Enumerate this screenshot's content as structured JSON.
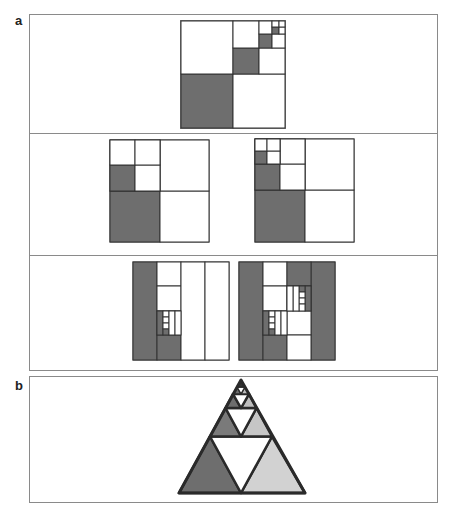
{
  "figure": {
    "panel_labels": {
      "a": "a",
      "b": "b"
    },
    "colors": {
      "dark_fill": "#6e6e6e",
      "medium_fill": "#8c8c8c",
      "light_fill": "#cfcfcf",
      "white_fill": "#ffffff",
      "line": "#333333",
      "border": "#8a8a8a"
    },
    "panel_a": {
      "description": "Geometric series of nested squares; one of every four sub-squares shaded (1/4 + 1/16 + ... = 1/3)",
      "rows": [
        {
          "name": "row-1",
          "items": [
            "recursive-square-diagonal"
          ]
        },
        {
          "name": "row-2",
          "items": [
            "recursive-square-left-column-variant-1",
            "recursive-square-left-column-variant-2"
          ]
        },
        {
          "name": "row-3",
          "items": [
            "column-strip-variant-1",
            "column-strip-variant-2"
          ]
        }
      ]
    },
    "panel_b": {
      "description": "Sierpinski-style nested triangle; each level split into four triangles with left shaded dark, right light, center white, top recursively subdivided"
    }
  }
}
